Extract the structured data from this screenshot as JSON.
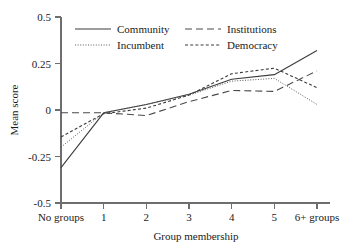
{
  "chart_data": {
    "type": "line",
    "title": "",
    "xlabel": "Group membership",
    "ylabel": "Mean score",
    "categories": [
      "No groups",
      "1",
      "2",
      "3",
      "4",
      "5",
      "6+ groups"
    ],
    "x_tick_labels": [
      "No groups",
      "1",
      "2",
      "3",
      "4",
      "5",
      "6+ groups"
    ],
    "y_tick_labels": [
      "0.5",
      "0.25",
      "0",
      "-0.25",
      "-0.5"
    ],
    "y_tick_values": [
      0.5,
      0.25,
      0,
      -0.25,
      -0.5
    ],
    "ylim": [
      -0.5,
      0.5
    ],
    "grid": false,
    "legend_position": "top-inside",
    "series": [
      {
        "name": "Community",
        "style": "solid",
        "color": "#3c3c3c",
        "values": [
          -0.31,
          -0.015,
          0.03,
          0.085,
          0.165,
          0.19,
          0.32
        ]
      },
      {
        "name": "Incumbent",
        "style": "dotted",
        "color": "#5a5a5a",
        "values": [
          -0.2,
          -0.015,
          0.03,
          0.08,
          0.155,
          0.17,
          0.03
        ]
      },
      {
        "name": "Institutions",
        "style": "dashed-long",
        "color": "#4a4a4a",
        "values": [
          -0.015,
          -0.015,
          -0.03,
          0.045,
          0.105,
          0.1,
          0.21
        ]
      },
      {
        "name": "Democracy",
        "style": "dashed-short",
        "color": "#3c3c3c",
        "values": [
          -0.145,
          -0.02,
          0.01,
          0.08,
          0.195,
          0.225,
          0.12
        ]
      }
    ]
  },
  "legend": {
    "entries": [
      {
        "label": "Community",
        "style": "solid"
      },
      {
        "label": "Incumbent",
        "style": "dotted"
      },
      {
        "label": "Institutions",
        "style": "dashed-long"
      },
      {
        "label": "Democracy",
        "style": "dashed-short"
      }
    ]
  },
  "axes": {
    "y_title": "Mean score",
    "x_title": "Group membership"
  }
}
